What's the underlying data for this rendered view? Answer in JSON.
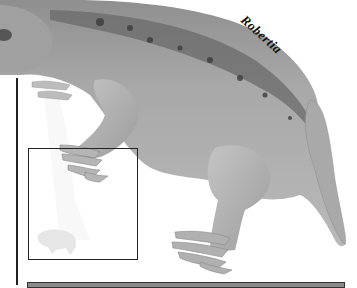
{
  "illustration": {
    "subject": "Robertia",
    "label": "Robertia",
    "palette": {
      "skin_light": "#bdbdbd",
      "skin_mid": "#9a9a9a",
      "skin_dark": "#5a5a5a",
      "spots": "#3c3c3c",
      "lines": "#222222"
    }
  },
  "inset": {
    "content": "scale-silhouette-icon"
  }
}
